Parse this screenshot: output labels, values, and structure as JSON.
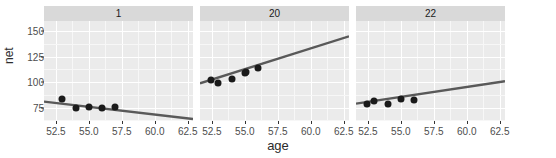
{
  "chart_data": {
    "type": "scatter",
    "title": "",
    "xlabel": "age",
    "ylabel": "net",
    "xlim": [
      51.6,
      62.9
    ],
    "ylim": [
      62,
      160
    ],
    "grid": true,
    "legend": "none",
    "facet_labels": [
      "1",
      "20",
      "22"
    ],
    "xticks": [
      "52.5",
      "55.0",
      "57.5",
      "60.0",
      "62.5"
    ],
    "xtick_values": [
      52.5,
      55.0,
      57.5,
      60.0,
      62.5
    ],
    "yticks": [
      "75",
      "100",
      "125",
      "150"
    ],
    "ytick_values": [
      75,
      100,
      125,
      150
    ],
    "panels": [
      {
        "label": "1",
        "points": [
          {
            "x": 53.0,
            "y": 84
          },
          {
            "x": 54.0,
            "y": 75
          },
          {
            "x": 55.0,
            "y": 76
          },
          {
            "x": 56.0,
            "y": 75
          },
          {
            "x": 57.0,
            "y": 76
          }
        ],
        "fit": {
          "x1": 51.6,
          "y1": 81,
          "x2": 62.9,
          "y2": 64
        },
        "series_name": "net vs age"
      },
      {
        "label": "20",
        "points": [
          {
            "x": 52.4,
            "y": 102
          },
          {
            "x": 53.0,
            "y": 99
          },
          {
            "x": 54.0,
            "y": 103
          },
          {
            "x": 55.0,
            "y": 109
          },
          {
            "x": 55.1,
            "y": 110
          },
          {
            "x": 56.0,
            "y": 114
          }
        ],
        "fit": {
          "x1": 51.6,
          "y1": 99,
          "x2": 62.9,
          "y2": 145
        },
        "series_name": "net vs age"
      },
      {
        "label": "22",
        "points": [
          {
            "x": 52.4,
            "y": 79
          },
          {
            "x": 53.0,
            "y": 82
          },
          {
            "x": 54.0,
            "y": 79
          },
          {
            "x": 55.0,
            "y": 84
          },
          {
            "x": 56.0,
            "y": 83
          }
        ],
        "fit": {
          "x1": 51.6,
          "y1": 79,
          "x2": 62.9,
          "y2": 101
        },
        "series_name": "net vs age"
      }
    ],
    "colors": {
      "panel_background": "#ebebeb",
      "strip_background": "#d9d9d9",
      "gridline_major": "#ffffff",
      "point": "#1a1a1a",
      "fit_line": "#595959",
      "axis_text": "#4d4d4d",
      "axis_title": "#2b2b2b"
    }
  }
}
